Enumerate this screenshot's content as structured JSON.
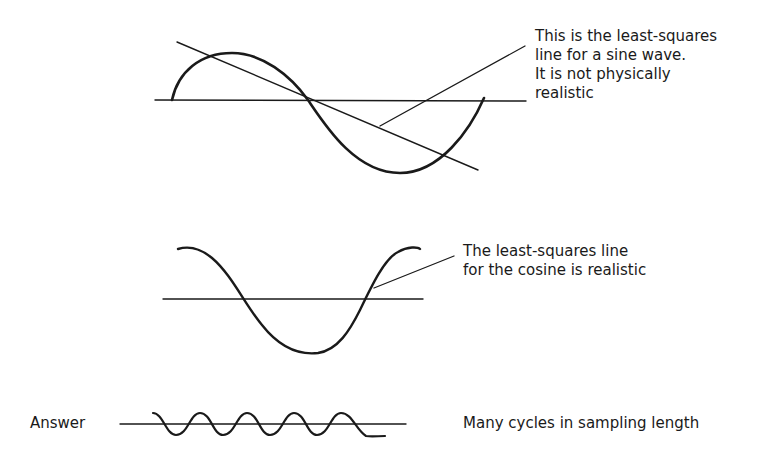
{
  "panels": {
    "sine": {
      "annotation": [
        "This is the least-squares",
        "line for a sine wave.",
        "It is not physically",
        "realistic"
      ]
    },
    "cosine": {
      "annotation": [
        "The least-squares line",
        "for the cosine is realistic"
      ]
    },
    "answer": {
      "label": "Answer",
      "annotation": "Many cycles in sampling length"
    }
  },
  "colors": {
    "ink": "#1a1a1a",
    "background": "#ffffff"
  }
}
